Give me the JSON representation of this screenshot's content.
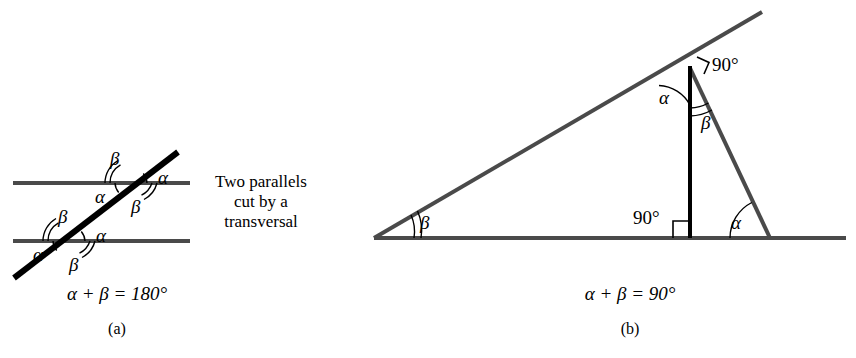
{
  "figure": {
    "title_implicit": "Angle relationships: parallels cut by a transversal, and complementary angles in a right triangle",
    "colors": {
      "ink_black": "#000000",
      "line_gray": "#4a4a4a",
      "background": "#ffffff"
    }
  },
  "panel_a": {
    "label": "(a)",
    "caption_lines": [
      "Two parallels",
      "cut by a",
      "transversal"
    ],
    "equation": "α + β = 180°",
    "angle_labels": [
      {
        "name": "upper-beta-top-left",
        "text": "β",
        "x": 110,
        "y": 150,
        "arcs": 2
      },
      {
        "name": "upper-alpha-top-right",
        "text": "α",
        "x": 158,
        "y": 169,
        "arcs": 1
      },
      {
        "name": "upper-alpha-bottom-left",
        "text": "α",
        "x": 95,
        "y": 188,
        "arcs": 1
      },
      {
        "name": "upper-beta-bottom-right",
        "text": "β",
        "x": 131,
        "y": 198,
        "arcs": 2
      },
      {
        "name": "lower-beta-top-left",
        "text": "β",
        "x": 58,
        "y": 208,
        "arcs": 2
      },
      {
        "name": "lower-alpha-top-right",
        "text": "α",
        "x": 96,
        "y": 227,
        "arcs": 1
      },
      {
        "name": "lower-alpha-bottom-left",
        "text": "α",
        "x": 33,
        "y": 246,
        "arcs": 1
      },
      {
        "name": "lower-beta-bottom-right",
        "text": "β",
        "x": 69,
        "y": 256,
        "arcs": 2
      }
    ],
    "geometry": {
      "parallel_line_top_y": 183,
      "parallel_line_bottom_y": 241,
      "parallel_line_x_start": 13,
      "parallel_line_x_end": 190,
      "transversal": {
        "x1": 14,
        "y1": 278,
        "x2": 178,
        "y2": 152
      }
    }
  },
  "panel_b": {
    "label": "(b)",
    "equation": "α + β = 90°",
    "angle_labels": [
      {
        "name": "apex-alpha",
        "text": "α",
        "x": 661,
        "y": 92,
        "arcs": 1
      },
      {
        "name": "apex-beta",
        "text": "β",
        "x": 703,
        "y": 117,
        "arcs": 2
      },
      {
        "name": "apex-right-angle",
        "text": "90°",
        "x": 712,
        "y": 63,
        "marker": "square"
      },
      {
        "name": "base-right-angle",
        "text": "90°",
        "x": 637,
        "y": 215,
        "marker": "square"
      },
      {
        "name": "left-vertex-beta",
        "text": "β",
        "x": 421,
        "y": 219,
        "arcs": 2
      },
      {
        "name": "right-vertex-alpha",
        "text": "α",
        "x": 733,
        "y": 219,
        "arcs": 1
      }
    ],
    "geometry": {
      "base_y": 238,
      "base_x_start": 374,
      "base_x_end": 846,
      "left_vertex": {
        "x": 374,
        "y": 238
      },
      "apex": {
        "x": 690,
        "y": 68
      },
      "right_vertex": {
        "x": 770,
        "y": 238
      },
      "hypotenuse_extension_end": {
        "x": 762,
        "y": 12
      },
      "altitude": {
        "x": 690,
        "y_top": 68,
        "y_bottom": 238
      }
    }
  }
}
